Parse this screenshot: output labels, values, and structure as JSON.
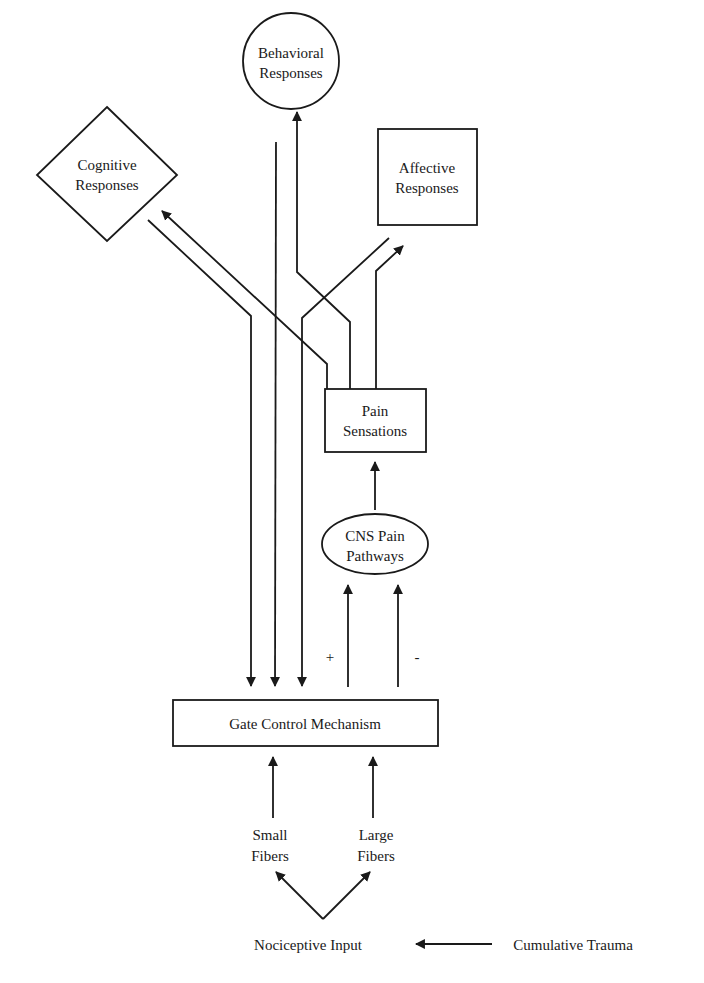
{
  "diagram": {
    "type": "flow-diagram",
    "nodes": {
      "behavioral": {
        "line1": "Behavioral",
        "line2": "Responses",
        "shape": "circle"
      },
      "cognitive": {
        "line1": "Cognitive",
        "line2": "Responses",
        "shape": "diamond"
      },
      "affective": {
        "line1": "Affective",
        "line2": "Responses",
        "shape": "rectangle"
      },
      "pain_sensations": {
        "line1": "Pain",
        "line2": "Sensations",
        "shape": "rectangle"
      },
      "cns": {
        "line1": "CNS Pain",
        "line2": "Pathways",
        "shape": "ellipse"
      },
      "gate": {
        "label": "Gate Control Mechanism",
        "shape": "rectangle"
      },
      "small_fibers": {
        "line1": "Small",
        "line2": "Fibers"
      },
      "large_fibers": {
        "line1": "Large",
        "line2": "Fibers"
      },
      "nociceptive": {
        "label": "Nociceptive Input"
      },
      "trauma": {
        "label": "Cumulative Trauma"
      }
    },
    "signs": {
      "plus": "+",
      "minus": "-"
    },
    "edges": [
      {
        "from": "Cumulative Trauma",
        "to": "Nociceptive Input"
      },
      {
        "from": "Nociceptive Input",
        "to": "Small Fibers"
      },
      {
        "from": "Nociceptive Input",
        "to": "Large Fibers"
      },
      {
        "from": "Small Fibers",
        "to": "Gate Control Mechanism"
      },
      {
        "from": "Large Fibers",
        "to": "Gate Control Mechanism"
      },
      {
        "from": "Gate Control Mechanism",
        "to": "CNS Pain Pathways",
        "sign": "+"
      },
      {
        "from": "Gate Control Mechanism",
        "to": "CNS Pain Pathways",
        "sign": "-"
      },
      {
        "from": "CNS Pain Pathways",
        "to": "Pain Sensations"
      },
      {
        "from": "Pain Sensations",
        "to": "Cognitive Responses"
      },
      {
        "from": "Pain Sensations",
        "to": "Behavioral Responses"
      },
      {
        "from": "Pain Sensations",
        "to": "Affective Responses"
      },
      {
        "from": "Cognitive Responses",
        "to": "Gate Control Mechanism"
      },
      {
        "from": "Behavioral Responses",
        "to": "Gate Control Mechanism"
      },
      {
        "from": "Affective Responses",
        "to": "Gate Control Mechanism"
      }
    ]
  }
}
